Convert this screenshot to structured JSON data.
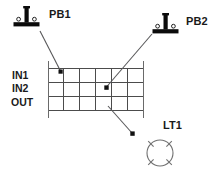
{
  "diagram": {
    "background_color": "#ffffff",
    "line_color": "#4c4c4c",
    "symbol_color": "#0b0b0b",
    "lamp_color": "#707070"
  },
  "components": {
    "pushbutton_1": {
      "label": "PB1",
      "icon": "pushbutton-symbol",
      "terminal_count": 2
    },
    "pushbutton_2": {
      "label": "PB2",
      "icon": "pushbutton-symbol",
      "terminal_count": 2
    },
    "lamp_1": {
      "label": "LT1",
      "icon": "lamp-symbol",
      "ray_count": 4
    }
  },
  "terminal_block": {
    "rows": [
      {
        "label": "IN1"
      },
      {
        "label": "IN2"
      },
      {
        "label": "OUT"
      }
    ],
    "columns": 6,
    "row_count": 3
  },
  "connections": [
    {
      "name": "pb1-to-in1",
      "from": "PB1",
      "to": "IN1",
      "marker": "arrow"
    },
    {
      "name": "pb2-to-in2",
      "from": "PB2",
      "to": "IN2",
      "marker": "arrow"
    },
    {
      "name": "out-to-lt1",
      "from": "OUT",
      "to": "LT1",
      "marker": "arrow"
    }
  ]
}
